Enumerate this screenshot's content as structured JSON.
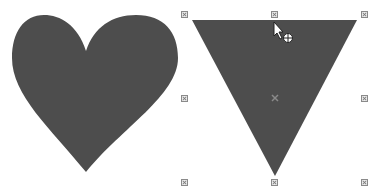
{
  "canvas": {
    "background": "#ffffff",
    "shapes": [
      {
        "type": "heart",
        "fill": "#4d4d4d",
        "selected": false
      },
      {
        "type": "inverted-triangle",
        "fill": "#4d4d4d",
        "selected": true
      }
    ]
  },
  "selection": {
    "handles": [
      "top-left",
      "top-center",
      "top-right",
      "middle-left",
      "center",
      "middle-right",
      "bottom-left",
      "bottom-center",
      "bottom-right"
    ],
    "handle_color": "#8a8a8a"
  },
  "cursor": {
    "type": "move-pointer"
  }
}
